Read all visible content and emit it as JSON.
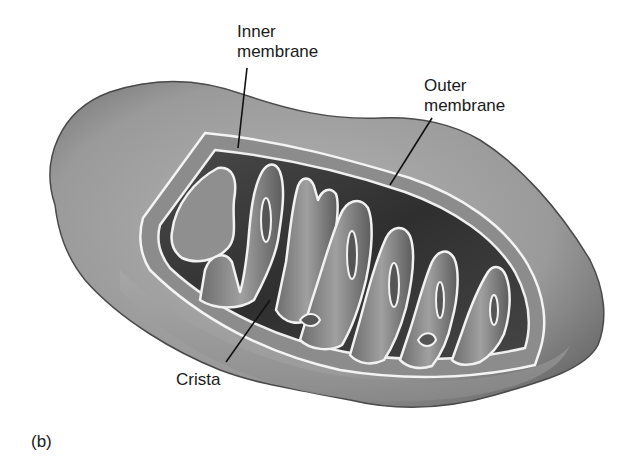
{
  "figure": {
    "panel_label": "(b)",
    "labels": {
      "inner_membrane": "Inner\nmembrane",
      "outer_membrane": "Outer\nmembrane",
      "crista": "Crista"
    },
    "colors": {
      "outer_body": "#9a9a9a",
      "outer_edge": "#4a4a4a",
      "matrix_dark": "#3c3c3c",
      "crista_fill": "#858585",
      "membrane_highlight": "#f2f2f2",
      "leader_line": "#111111",
      "background": "#ffffff"
    }
  }
}
